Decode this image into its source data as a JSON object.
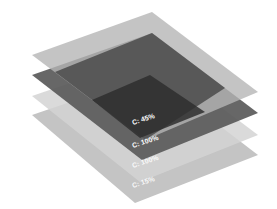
{
  "diagram": {
    "type": "stacked-layers",
    "layers": [
      {
        "id": "layer-1",
        "label": "C: 45%",
        "fill": "#b4b4b4",
        "opacity": 0.95
      },
      {
        "id": "layer-2",
        "label": "C: 100%",
        "fill": "#555555",
        "opacity": 0.9
      },
      {
        "id": "layer-3",
        "label": "C: 100%",
        "fill": "#c8c8c8",
        "opacity": 0.75
      },
      {
        "id": "layer-4",
        "label": "C: 15%",
        "fill": "#c4c4c4",
        "opacity": 0.85
      }
    ],
    "overlap_fill": "#3c3c3c",
    "label_color": "#ffffff",
    "background": "#ffffff"
  }
}
